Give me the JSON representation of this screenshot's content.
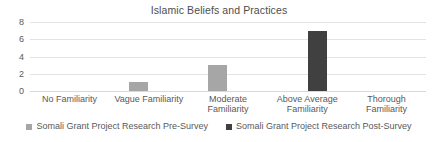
{
  "chart_data": {
    "type": "bar",
    "title": "Islamic Beliefs and Practices",
    "xlabel": "",
    "ylabel": "",
    "ylim": [
      0,
      8
    ],
    "yticks": [
      0,
      2,
      4,
      6,
      8
    ],
    "grid": true,
    "legend_position": "bottom",
    "categories": [
      "No Familiarity",
      "Vague Familiarity",
      "Moderate Familiarity",
      "Above Average Familiarity",
      "Thorough Familiarity"
    ],
    "series": [
      {
        "name": "Somali Grant Project Research Pre-Survey",
        "color": "#A6A6A6",
        "values": [
          0,
          1,
          3,
          0,
          0
        ]
      },
      {
        "name": "Somali Grant Project Research Post-Survey",
        "color": "#404040",
        "values": [
          0,
          0,
          0,
          7,
          0
        ]
      }
    ]
  }
}
